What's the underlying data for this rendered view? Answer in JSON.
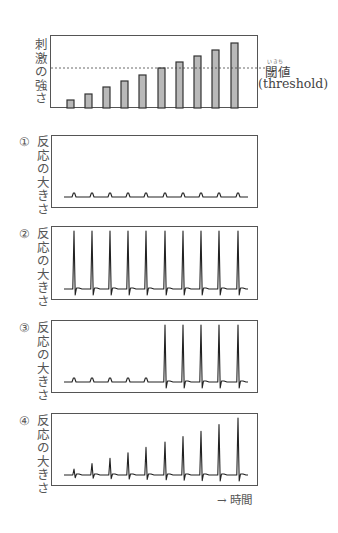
{
  "stimulus_chart": {
    "ylabel": "刺激の強さ",
    "threshold_label": "閾値",
    "threshold_ruby": "いきち",
    "threshold_english": "(threshold)",
    "threshold_level": 0.55,
    "bar_values": [
      0.1,
      0.22,
      0.34,
      0.46,
      0.58,
      0.7,
      0.82,
      0.94,
      1.06,
      1.18
    ],
    "bar_fill": "#b9b9b9"
  },
  "panels": [
    {
      "number": "①",
      "ylabel": "反応の大きさ",
      "peaks": [
        0.06,
        0.06,
        0.06,
        0.06,
        0.06,
        0.06,
        0.06,
        0.06,
        0.06,
        0.06
      ],
      "undershoot": [
        0,
        0,
        0,
        0,
        0,
        0,
        0,
        0,
        0,
        0
      ]
    },
    {
      "number": "②",
      "ylabel": "反応の大きさ",
      "peaks": [
        1,
        1,
        1,
        1,
        1,
        1,
        1,
        1,
        1,
        1
      ],
      "undershoot": [
        1,
        1,
        1,
        1,
        1,
        1,
        1,
        1,
        1,
        1
      ]
    },
    {
      "number": "③",
      "ylabel": "反応の大きさ",
      "peaks": [
        0.06,
        0.06,
        0.06,
        0.06,
        0.06,
        1,
        1,
        1,
        1,
        1
      ],
      "undershoot": [
        0,
        0,
        0,
        0,
        0,
        1,
        1,
        1,
        1,
        1
      ]
    },
    {
      "number": "④",
      "ylabel": "反応の大きさ",
      "peaks": [
        0.1,
        0.19,
        0.28,
        0.37,
        0.46,
        0.55,
        0.64,
        0.73,
        0.84,
        0.95
      ],
      "undershoot": [
        0.2,
        0.3,
        0.4,
        0.5,
        0.6,
        0.7,
        0.8,
        0.9,
        1,
        1
      ]
    }
  ],
  "time_axis": {
    "label": "→ 時間"
  },
  "chart_data": [
    {
      "type": "bar",
      "title": "",
      "ylabel": "刺激の強さ",
      "xlabel": "",
      "categories": [
        "1",
        "2",
        "3",
        "4",
        "5",
        "6",
        "7",
        "8",
        "9",
        "10"
      ],
      "values": [
        0.1,
        0.22,
        0.34,
        0.46,
        0.58,
        0.7,
        0.82,
        0.94,
        1.06,
        1.18
      ],
      "annotations": [
        {
          "type": "hline",
          "y": 0.7,
          "style": "dashed",
          "label": "閾値 (threshold)"
        }
      ],
      "grid": false
    },
    {
      "type": "line",
      "title": "①",
      "ylabel": "反応の大きさ",
      "xlabel": "時間",
      "series": [
        {
          "name": "①",
          "peak_heights": [
            0.06,
            0.06,
            0.06,
            0.06,
            0.06,
            0.06,
            0.06,
            0.06,
            0.06,
            0.06
          ]
        }
      ]
    },
    {
      "type": "line",
      "title": "②",
      "ylabel": "反応の大きさ",
      "xlabel": "時間",
      "series": [
        {
          "name": "②",
          "peak_heights": [
            1,
            1,
            1,
            1,
            1,
            1,
            1,
            1,
            1,
            1
          ]
        }
      ]
    },
    {
      "type": "line",
      "title": "③",
      "ylabel": "反応の大きさ",
      "xlabel": "時間",
      "series": [
        {
          "name": "③",
          "peak_heights": [
            0.06,
            0.06,
            0.06,
            0.06,
            0.06,
            1,
            1,
            1,
            1,
            1
          ]
        }
      ]
    },
    {
      "type": "line",
      "title": "④",
      "ylabel": "反応の大きさ",
      "xlabel": "時間",
      "series": [
        {
          "name": "④",
          "peak_heights": [
            0.1,
            0.19,
            0.28,
            0.37,
            0.46,
            0.55,
            0.64,
            0.73,
            0.84,
            0.95
          ]
        }
      ]
    }
  ]
}
